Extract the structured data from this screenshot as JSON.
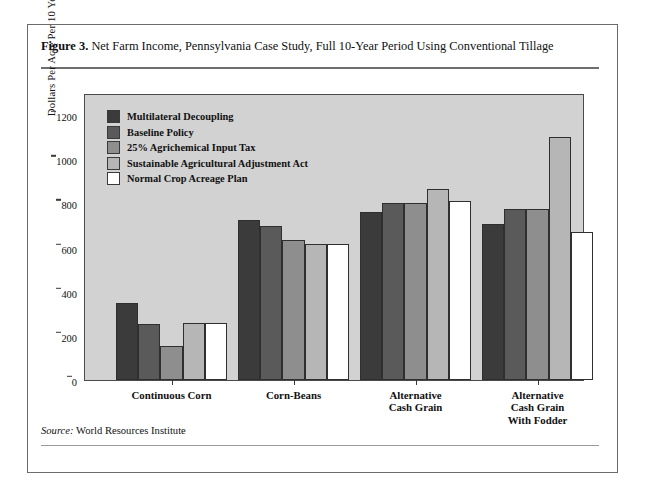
{
  "caption": {
    "figure_number": "Figure 3.",
    "text": "Net Farm Income, Pennsylvania Case Study, Full 10-Year Period Using Conventional Tillage"
  },
  "source": {
    "label": "Source:",
    "text": "World Resources Institute"
  },
  "colors": {
    "plot_background": "#d2d2d2",
    "frame": "#6b6b6b",
    "axis": "#3a3a3a",
    "series": [
      "#3b3b3b",
      "#5a5a5a",
      "#8e8e8e",
      "#b6b6b6",
      "#ffffff"
    ]
  },
  "chart_data": {
    "type": "bar",
    "title": "Net Farm Income, Pennsylvania Case Study, Full 10-Year Period Using Conventional Tillage",
    "xlabel": "",
    "ylabel": "Dollars Per Acre Per 10 Years",
    "ylim": [
      0,
      1300
    ],
    "yticks": [
      0,
      200,
      400,
      600,
      800,
      1000,
      1200
    ],
    "ytick_labels": [
      "0",
      "200",
      "400",
      "600",
      "800",
      "1000",
      "1200"
    ],
    "grid": false,
    "legend_position": "upper-left inside plot",
    "categories": [
      "Continuous Corn",
      "Corn-Beans",
      "Alternative\nCash Grain",
      "Alternative\nCash Grain\nWith Fodder"
    ],
    "category_lines": [
      [
        "Continuous Corn"
      ],
      [
        "Corn-Beans"
      ],
      [
        "Alternative",
        "Cash Grain"
      ],
      [
        "Alternative",
        "Cash Grain",
        "With Fodder"
      ]
    ],
    "series": [
      {
        "name": "Multilateral Decoupling",
        "color": "#3b3b3b",
        "values": [
          350,
          725,
          760,
          705
        ]
      },
      {
        "name": "Baseline Policy",
        "color": "#5a5a5a",
        "values": [
          255,
          698,
          800,
          775
        ]
      },
      {
        "name": "25%  Agrichemical Input Tax",
        "color": "#8e8e8e",
        "values": [
          155,
          632,
          800,
          775
        ]
      },
      {
        "name": "Sustainable Agricultural Adjustment Act",
        "color": "#b6b6b6",
        "values": [
          260,
          615,
          865,
          1100
        ]
      },
      {
        "name": "Normal Crop Acreage Plan",
        "color": "#ffffff",
        "values": [
          260,
          615,
          810,
          670
        ]
      }
    ]
  }
}
